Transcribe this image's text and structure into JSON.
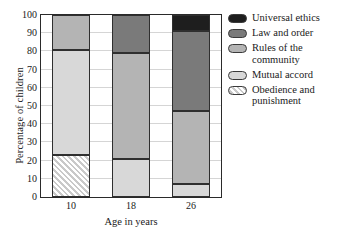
{
  "chart_data": {
    "type": "bar",
    "subtype": "stacked-bar",
    "title": "",
    "xlabel": "Age in years",
    "ylabel": "Percentage of children",
    "categories": [
      "10",
      "18",
      "26"
    ],
    "ylim": [
      0,
      100
    ],
    "yticks": [
      0,
      10,
      20,
      30,
      40,
      50,
      60,
      70,
      80,
      90,
      100
    ],
    "ytick_labels": [
      "0",
      "10",
      "20",
      "30",
      "40",
      "50",
      "60",
      "70",
      "80",
      "90",
      "100"
    ],
    "grid": true,
    "legend_position": "right",
    "stack_order_bottom_to_top": [
      "Obedience and punishment",
      "Mutual accord",
      "Rules of the community",
      "Law and order",
      "Universal ethics"
    ],
    "series": [
      {
        "name": "Universal ethics",
        "color": "#1e1e1e",
        "pattern": "solid",
        "values": [
          0,
          0,
          9
        ],
        "cumulative_top": [
          100,
          100,
          100
        ]
      },
      {
        "name": "Law and order",
        "color": "#7a7a7a",
        "pattern": "solid",
        "values": [
          0,
          21,
          44
        ],
        "cumulative_top": [
          100,
          100,
          91
        ]
      },
      {
        "name": "Rules of the community",
        "color": "#b4b4b4",
        "pattern": "solid",
        "values": [
          19,
          58,
          40
        ],
        "cumulative_top": [
          100,
          79,
          47
        ]
      },
      {
        "name": "Mutual accord",
        "color": "#d8d8d8",
        "pattern": "solid",
        "values": [
          58,
          21,
          7
        ],
        "cumulative_top": [
          81,
          21,
          7
        ]
      },
      {
        "name": "Obedience and punishment",
        "color": "#ffffff",
        "pattern": "diagonal-hatch",
        "values": [
          23,
          0,
          0
        ],
        "cumulative_top": [
          23,
          0,
          0
        ]
      }
    ]
  },
  "legend": {
    "items": [
      {
        "label": "Universal ethics",
        "color": "#1e1e1e",
        "pattern": "solid"
      },
      {
        "label": "Law and order",
        "color": "#7a7a7a",
        "pattern": "solid"
      },
      {
        "label": "Rules of the\ncommunity",
        "color": "#b4b4b4",
        "pattern": "solid"
      },
      {
        "label": "Mutual accord",
        "color": "#d8d8d8",
        "pattern": "solid"
      },
      {
        "label": "Obedience and\npunishment",
        "color": "#ffffff",
        "pattern": "diagonal-hatch"
      }
    ]
  }
}
